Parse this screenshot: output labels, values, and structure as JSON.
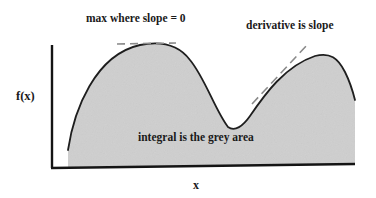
{
  "diagram": {
    "labels": {
      "max": "max where slope = 0",
      "derivative": "derivative is slope",
      "y_axis": "f(x)",
      "integral": "integral is the grey area",
      "x_axis": "x"
    },
    "colors": {
      "fill": "#cfcfcf",
      "curve": "#1e1e1e",
      "axis": "#141414",
      "tangent": "#8a8a8a",
      "text": "#1a1a1a"
    },
    "curve_path": "M 68 150 C 74 110, 95 55, 140 45 C 160 41, 178 44, 190 60 C 205 78, 215 110, 228 127 C 235 132, 243 126, 250 116 C 265 94, 285 66, 315 56 C 330 52, 338 58, 345 72 C 350 82, 353 92, 355 100",
    "fill_path": "M 68 150 C 74 110, 95 55, 140 45 C 160 41, 178 44, 190 60 C 205 78, 215 110, 228 127 C 235 132, 243 126, 250 116 C 265 94, 285 66, 315 56 C 330 52, 338 58, 345 72 C 350 82, 353 92, 355 100 L 355 164 L 68 167 Z",
    "tangent_max": {
      "x1": 117,
      "y1": 44,
      "x2": 176,
      "y2": 43
    },
    "tangent_slope": {
      "x1": 252,
      "y1": 104,
      "x2": 308,
      "y2": 44
    },
    "axes": {
      "y_axis": {
        "x1": 52,
        "y1": 45,
        "x2": 52,
        "y2": 168
      },
      "x_axis": {
        "x1": 51,
        "y1": 168,
        "x2": 355,
        "y2": 164
      }
    }
  }
}
